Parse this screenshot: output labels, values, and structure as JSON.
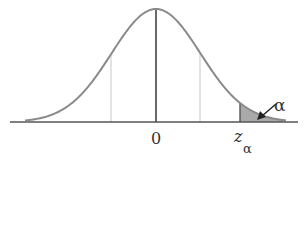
{
  "figure": {
    "type": "normal-distribution-diagram",
    "labels": {
      "center": "0",
      "critical_value_main": "z",
      "critical_value_subscript": "α",
      "tail_area": "α"
    },
    "colors": {
      "curve": "#8a8a8a",
      "axis": "#555555",
      "center_line": "#444444",
      "guide_lines": "#c8c8c8",
      "shaded_tail": "#aaaaaa",
      "arrow": "#222222"
    },
    "geometry": {
      "baseline_y": 122,
      "peak_y": 9,
      "center_x": 156,
      "sigma_px": 44.5,
      "curve_start_x": 25,
      "curve_end_x": 286,
      "axis_start_x": 10,
      "axis_end_x": 298,
      "guide_left_x": 111,
      "guide_right_x": 200,
      "critical_x": 240
    }
  }
}
